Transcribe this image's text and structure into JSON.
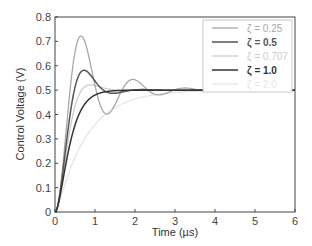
{
  "chart_data": {
    "type": "line",
    "title": "",
    "xlabel": "Time (µs)",
    "ylabel": "Control Voltage (V)",
    "xlim": [
      0,
      6
    ],
    "ylim": [
      0,
      0.8
    ],
    "xticks": [
      "0",
      "1",
      "2",
      "3",
      "4",
      "5",
      "6"
    ],
    "yticks": [
      "0",
      "0.1",
      "0.2",
      "0.3",
      "0.4",
      "0.5",
      "0.6",
      "0.7",
      "0.8"
    ],
    "grid": false,
    "legend_position": "upper right",
    "final_value": 0.5,
    "natural_frequency_rad_per_us": 5,
    "series": [
      {
        "name": "ζ = 0.25",
        "zeta": 0.25,
        "color": "#a8a8a8",
        "width": 1.3,
        "bold": false
      },
      {
        "name": "ζ = 0.5",
        "zeta": 0.5,
        "color": "#555555",
        "width": 1.5,
        "bold": true
      },
      {
        "name": "ζ = 0.707",
        "zeta": 0.707,
        "color": "#cccccc",
        "width": 1.3,
        "bold": false
      },
      {
        "name": "ζ = 1.0",
        "zeta": 1.0,
        "color": "#333333",
        "width": 1.5,
        "bold": true
      },
      {
        "name": "ζ = 2.0",
        "zeta": 2.0,
        "color": "#e6e6e6",
        "width": 1.3,
        "bold": false
      }
    ]
  }
}
